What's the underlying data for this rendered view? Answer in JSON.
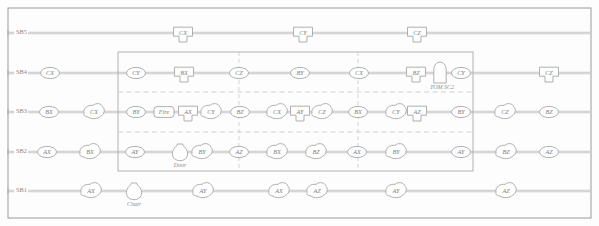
{
  "diagram": {
    "frame": {
      "x": 8,
      "y": 8,
      "width": 583,
      "height": 210
    },
    "inner_box": {
      "x": 118,
      "y": 52,
      "width": 355,
      "height": 119
    },
    "colors": {
      "stroke": "#9c9c9c",
      "rail": "#b2b2b2",
      "dashed": "#bdbdbd",
      "text": "#7d7d7d",
      "background": "#fdfdfd"
    },
    "rows": [
      {
        "id": "SB5",
        "label": "SB5",
        "y": 33,
        "nodes": [
          {
            "label": "CX",
            "x": 183,
            "shape": "shield"
          },
          {
            "label": "CY",
            "x": 303,
            "shape": "shield"
          },
          {
            "label": "CZ",
            "x": 417,
            "shape": "shield"
          }
        ]
      },
      {
        "id": "SB4",
        "label": "SB4",
        "y": 73,
        "nodes": [
          {
            "label": "CX",
            "x": 50,
            "shape": "ellipse"
          },
          {
            "label": "CY",
            "x": 136,
            "shape": "ellipse"
          },
          {
            "label": "BX",
            "x": 184,
            "shape": "shield"
          },
          {
            "label": "CZ",
            "x": 239,
            "shape": "ellipse"
          },
          {
            "label": "BY",
            "x": 300,
            "shape": "ellipse"
          },
          {
            "label": "CX",
            "x": 359,
            "shape": "ellipse"
          },
          {
            "label": "BZ",
            "x": 416,
            "shape": "shield"
          },
          {
            "label": "TOM SC2",
            "x": 440,
            "shape": "arch",
            "caption": "TOM SC2"
          },
          {
            "label": "CY",
            "x": 461,
            "shape": "ellipse"
          },
          {
            "label": "CZ",
            "x": 549,
            "shape": "shield"
          }
        ]
      },
      {
        "id": "SB3",
        "label": "SB3",
        "y": 112,
        "nodes": [
          {
            "label": "BX",
            "x": 49,
            "shape": "ellipse"
          },
          {
            "label": "CX",
            "x": 94,
            "shape": "blob"
          },
          {
            "label": "BY",
            "x": 136,
            "shape": "ellipse"
          },
          {
            "label": "Fire",
            "x": 164,
            "shape": "rounded-rect"
          },
          {
            "label": "AX",
            "x": 188,
            "shape": "shield"
          },
          {
            "label": "CY",
            "x": 211,
            "shape": "blob"
          },
          {
            "label": "BZ",
            "x": 240,
            "shape": "ellipse"
          },
          {
            "label": "CX",
            "x": 277,
            "shape": "blob"
          },
          {
            "label": "AY",
            "x": 300,
            "shape": "shield"
          },
          {
            "label": "CZ",
            "x": 322,
            "shape": "blob"
          },
          {
            "label": "BX",
            "x": 358,
            "shape": "ellipse"
          },
          {
            "label": "CY",
            "x": 396,
            "shape": "blob"
          },
          {
            "label": "AZ",
            "x": 417,
            "shape": "shield"
          },
          {
            "label": "BY",
            "x": 461,
            "shape": "ellipse"
          },
          {
            "label": "CZ",
            "x": 505,
            "shape": "blob"
          },
          {
            "label": "BZ",
            "x": 549,
            "shape": "ellipse"
          }
        ]
      },
      {
        "id": "SB2",
        "label": "SB2",
        "y": 152,
        "nodes": [
          {
            "label": "AX",
            "x": 47,
            "shape": "ellipse"
          },
          {
            "label": "BX",
            "x": 90,
            "shape": "blob"
          },
          {
            "label": "AY",
            "x": 135,
            "shape": "ellipse"
          },
          {
            "label": "Door",
            "x": 180,
            "shape": "vase",
            "caption": "Door"
          },
          {
            "label": "BY",
            "x": 202,
            "shape": "blob"
          },
          {
            "label": "AZ",
            "x": 239,
            "shape": "ellipse"
          },
          {
            "label": "BX",
            "x": 277,
            "shape": "blob"
          },
          {
            "label": "BZ",
            "x": 316,
            "shape": "blob"
          },
          {
            "label": "AX",
            "x": 357,
            "shape": "ellipse"
          },
          {
            "label": "BY",
            "x": 396,
            "shape": "blob"
          },
          {
            "label": "AY",
            "x": 461,
            "shape": "ellipse"
          },
          {
            "label": "BZ",
            "x": 506,
            "shape": "blob"
          },
          {
            "label": "AZ",
            "x": 549,
            "shape": "ellipse"
          }
        ]
      },
      {
        "id": "SB1",
        "label": "SB1",
        "y": 191,
        "nodes": [
          {
            "label": "AX",
            "x": 91,
            "shape": "blob"
          },
          {
            "label": "Chair",
            "x": 134,
            "shape": "vase",
            "caption": "Chair"
          },
          {
            "label": "AY",
            "x": 203,
            "shape": "blob"
          },
          {
            "label": "AX",
            "x": 279,
            "shape": "blob"
          },
          {
            "label": "AZ",
            "x": 317,
            "shape": "blob"
          },
          {
            "label": "AY",
            "x": 396,
            "shape": "blob"
          },
          {
            "label": "AZ",
            "x": 506,
            "shape": "blob"
          }
        ]
      }
    ],
    "dashed_horizontals": [
      {
        "y": 92,
        "x1": 118,
        "x2": 473
      },
      {
        "y": 132,
        "x1": 118,
        "x2": 473
      }
    ],
    "dashed_verticals": [
      {
        "x": 239,
        "y1": 52,
        "y2": 171
      },
      {
        "x": 358,
        "y1": 52,
        "y2": 171
      }
    ]
  }
}
